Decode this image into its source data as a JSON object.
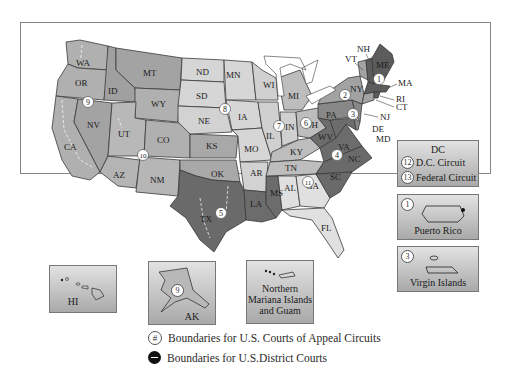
{
  "map": {
    "title_legend": {
      "circuit_boundaries": "Boundaries for U.S. Courts of Appeal Circuits",
      "district_boundaries": "Boundaries for U.S.District Courts",
      "circuit_symbol": "#"
    },
    "states": [
      {
        "abbr": "WA"
      },
      {
        "abbr": "OR"
      },
      {
        "abbr": "CA"
      },
      {
        "abbr": "NV"
      },
      {
        "abbr": "ID"
      },
      {
        "abbr": "MT"
      },
      {
        "abbr": "WY"
      },
      {
        "abbr": "UT"
      },
      {
        "abbr": "CO"
      },
      {
        "abbr": "AZ"
      },
      {
        "abbr": "NM"
      },
      {
        "abbr": "ND"
      },
      {
        "abbr": "SD"
      },
      {
        "abbr": "NE"
      },
      {
        "abbr": "KS"
      },
      {
        "abbr": "OK"
      },
      {
        "abbr": "TX"
      },
      {
        "abbr": "MN"
      },
      {
        "abbr": "IA"
      },
      {
        "abbr": "MO"
      },
      {
        "abbr": "AR"
      },
      {
        "abbr": "LA"
      },
      {
        "abbr": "MS"
      },
      {
        "abbr": "WI"
      },
      {
        "abbr": "IL"
      },
      {
        "abbr": "MI"
      },
      {
        "abbr": "IN"
      },
      {
        "abbr": "OH"
      },
      {
        "abbr": "KY"
      },
      {
        "abbr": "TN"
      },
      {
        "abbr": "AL"
      },
      {
        "abbr": "GA"
      },
      {
        "abbr": "FL"
      },
      {
        "abbr": "SC"
      },
      {
        "abbr": "NC"
      },
      {
        "abbr": "VA"
      },
      {
        "abbr": "WV"
      },
      {
        "abbr": "PA"
      },
      {
        "abbr": "NY"
      },
      {
        "abbr": "VT"
      },
      {
        "abbr": "NH"
      },
      {
        "abbr": "ME"
      },
      {
        "abbr": "MA"
      },
      {
        "abbr": "RI"
      },
      {
        "abbr": "CT"
      },
      {
        "abbr": "NJ"
      },
      {
        "abbr": "DE"
      },
      {
        "abbr": "MD"
      }
    ],
    "circuit_markers": [
      "1",
      "2",
      "3",
      "4",
      "5",
      "6",
      "7",
      "8",
      "9",
      "10",
      "11"
    ],
    "insets": {
      "dc": {
        "title": "DC",
        "rows": [
          {
            "num": "12",
            "label": "D.C. Circuit"
          },
          {
            "num": "13",
            "label": "Federal Circuit"
          }
        ]
      },
      "puerto_rico": {
        "num": "1",
        "label": "Puerto Rico"
      },
      "virgin_islands": {
        "num": "3",
        "label": "Virgin Islands"
      },
      "hawaii": {
        "label": "HI"
      },
      "alaska": {
        "num": "9",
        "label": "AK"
      },
      "marianas": {
        "label_lines": [
          "Northern",
          "Mariana Islands",
          "and Guam"
        ]
      }
    },
    "colors": {
      "light": "#d9d9d9",
      "medium": "#b3b3b3",
      "mediumdark": "#9a9a9a",
      "dark": "#6e6e6e",
      "darkest": "#555555",
      "border": "#333333"
    }
  }
}
